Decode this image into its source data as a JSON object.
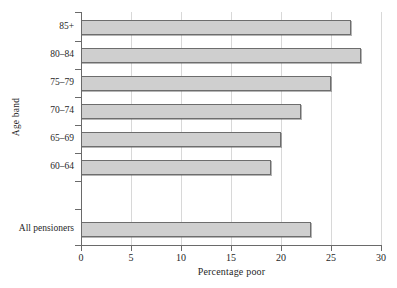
{
  "chart_data": {
    "type": "bar",
    "orientation": "horizontal",
    "title": "",
    "xlabel": "Percentage poor",
    "ylabel": "Age band",
    "xlim": [
      0,
      30
    ],
    "xticks": [
      0,
      5,
      10,
      15,
      20,
      25,
      30
    ],
    "xtick_labels": [
      "0",
      "5",
      "10",
      "15",
      "20",
      "25",
      "30"
    ],
    "grid": "vertical",
    "legend": "none",
    "categories": [
      "85+",
      "80–84",
      "75–79",
      "70–74",
      "65–69",
      "60–64",
      "All pensioners"
    ],
    "values": [
      27,
      28,
      25,
      22,
      20,
      19,
      23
    ],
    "bars": [
      {
        "category": "85+",
        "value": 27
      },
      {
        "category": "80–84",
        "value": 28
      },
      {
        "category": "75–79",
        "value": 25
      },
      {
        "category": "70–74",
        "value": 22
      },
      {
        "category": "65–69",
        "value": 20
      },
      {
        "category": "60–64",
        "value": 19
      },
      {
        "category": "All pensioners",
        "value": 23
      }
    ],
    "colors": {
      "bar_fill": "#cfcfcf",
      "bar_edge": "#6d6d6d",
      "axis": "#6a6a6a",
      "grid": "#d8d8d8",
      "text": "#1f1f1f",
      "background": "#ffffff"
    }
  },
  "footnote": ""
}
